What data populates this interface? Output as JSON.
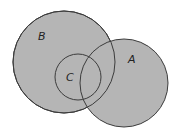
{
  "diagram": {
    "type": "venn",
    "fill_color": "#b5b5b5",
    "stroke_color": "#3c3c3c",
    "sets": [
      {
        "id": "B",
        "label": "B",
        "cx": 64,
        "cy": 62,
        "r": 51
      },
      {
        "id": "A",
        "label": "A",
        "cx": 124,
        "cy": 83,
        "r": 44
      },
      {
        "id": "C",
        "label": "C",
        "cx": 78,
        "cy": 77,
        "r": 23
      }
    ],
    "labels": {
      "B": "B",
      "A": "A",
      "C": "C"
    }
  }
}
